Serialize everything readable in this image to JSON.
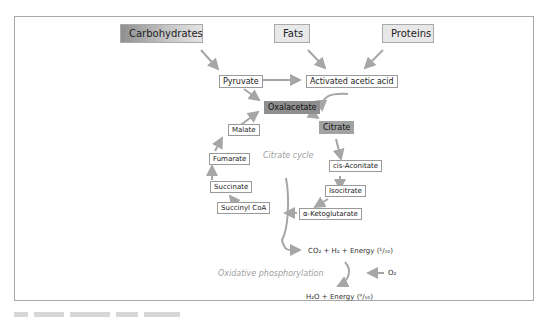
{
  "diagram": {
    "sources": [
      {
        "label": "Carbohydrates"
      },
      {
        "label": "Fats"
      },
      {
        "label": "Proteins"
      }
    ],
    "intermediates": {
      "pyruvate": "Pyruvate",
      "activated_acetic_acid": "Activated acetic acid"
    },
    "cycle": {
      "title": "Citrate cycle",
      "nodes": {
        "oxalacetate": "Oxalacetate",
        "citrate": "Citrate",
        "cis_aconitate": "cis-Aconitate",
        "isocitrate": "Isocitrate",
        "ketoglutarate": "α-Ketoglutarate",
        "succinyl_coa": "Succinyl CoA",
        "succinate": "Succinate",
        "fumarate": "Fumarate",
        "malate": "Malate"
      }
    },
    "outputs": {
      "co2_line": "CO₂ + H₂ + Energy (¹/₁₀)",
      "o2": "O₂",
      "oxidative_label": "Oxidative phosphorylation",
      "h2o_line": "H₂O + Energy (⁹/₁₀)"
    },
    "colors": {
      "arrow": "#a6a6a6",
      "dark_box": "#8e8e8e",
      "mid_box": "#a2a2a2",
      "border": "#a8a8a8",
      "italic_text": "#a0a0a0"
    }
  }
}
